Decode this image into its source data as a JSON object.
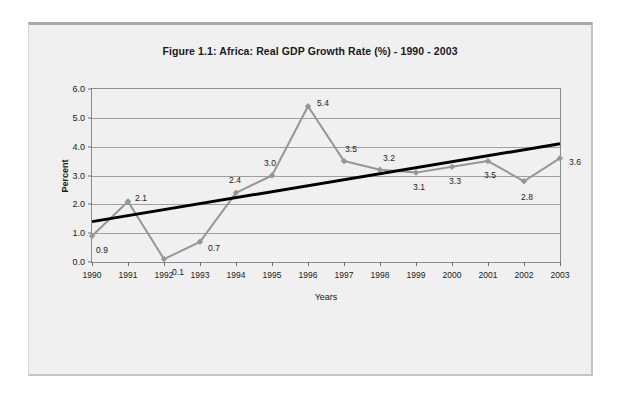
{
  "page": {
    "background_color": "#f0f0f0",
    "border_color": "#c4c4c4"
  },
  "chart_data": {
    "type": "line",
    "title": "Figure 1.1: Africa: Real GDP Growth Rate (%) - 1990 - 2003",
    "xlabel": "Years",
    "ylabel": "Percent",
    "categories": [
      "1990",
      "1991",
      "1992",
      "1993",
      "1994",
      "1995",
      "1996",
      "1997",
      "1998",
      "1999",
      "2000",
      "2001",
      "2002",
      "2003"
    ],
    "values": [
      0.9,
      2.1,
      0.1,
      0.7,
      2.4,
      3.0,
      5.4,
      3.5,
      3.2,
      3.1,
      3.3,
      3.5,
      2.8,
      3.6
    ],
    "data_labels": [
      "0.9",
      "2.1",
      "0.1",
      "0.7",
      "2.4",
      "3.0",
      "5.4",
      "3.5",
      "3.2",
      "3.1",
      "3.3",
      "3.5",
      "2.8",
      "3.6"
    ],
    "ylim": [
      0.0,
      6.0
    ],
    "ytick_labels": [
      "0.0",
      "1.0",
      "2.0",
      "3.0",
      "4.0",
      "5.0",
      "6.0"
    ],
    "ytick_values": [
      0.0,
      1.0,
      2.0,
      3.0,
      4.0,
      5.0,
      6.0
    ],
    "grid": true,
    "legend": false,
    "series_color": "#969696",
    "marker": "diamond",
    "trendline": {
      "type": "linear",
      "color": "#000000",
      "start_value": 1.4,
      "end_value": 4.1,
      "start_category": "1990",
      "end_category": "2003"
    }
  }
}
